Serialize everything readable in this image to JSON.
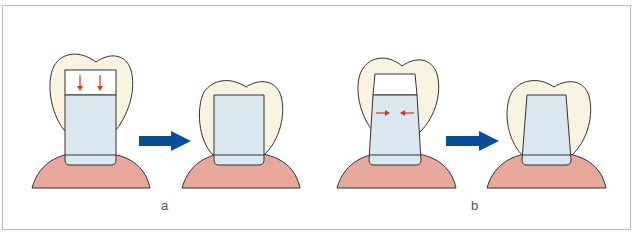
{
  "figure": {
    "panels": [
      {
        "id": "a",
        "label": "a",
        "description": "Parallel-walled post: seating force directed vertically (downward arrows); post seats fully"
      },
      {
        "id": "b",
        "label": "b",
        "description": "Tapered post: seating force directed laterally (inward arrows); post seats with wedging"
      }
    ],
    "colors": {
      "crown_fill": "#f8f4e1",
      "post_fill": "#dbe8ef",
      "gum_fill": "#e8a89b",
      "outline": "#333333",
      "force_arrow": "#e0301e",
      "transition_arrow": "#0b4c97",
      "frame_border": "#bdbdbd",
      "label_text": "#555555"
    },
    "icons": {
      "force_arrow_down": "red-down-arrow",
      "force_arrow_inward": "red-inward-arrow",
      "transition_arrow": "blue-right-arrow"
    }
  }
}
